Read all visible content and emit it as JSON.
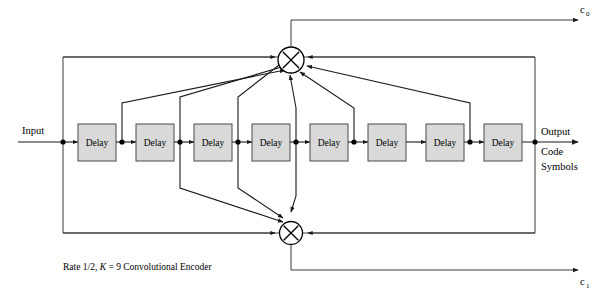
{
  "figure": {
    "type": "block-diagram",
    "title": "Rate 1/2, K = 9 Convolutional Encoder",
    "caption_parts": {
      "before": "Rate 1/2, ",
      "italic": "K",
      "after": " = 9 Convolutional Encoder"
    },
    "background_color": "#ffffff",
    "line_color": "#1a1a1a",
    "delay_fill_color": "#d9d9d9",
    "delay_stroke_color": "#4a4a4a"
  },
  "labels": {
    "input": "Input",
    "output_line1": "Output",
    "output_line2": "Code",
    "output_line3": "Symbols",
    "c0_base": "c",
    "c0_sub": "0",
    "c1_base": "c",
    "c1_sub": "1"
  },
  "delays": [
    {
      "label": "Delay",
      "index": 1
    },
    {
      "label": "Delay",
      "index": 2
    },
    {
      "label": "Delay",
      "index": 3
    },
    {
      "label": "Delay",
      "index": 4
    },
    {
      "label": "Delay",
      "index": 5
    },
    {
      "label": "Delay",
      "index": 6
    },
    {
      "label": "Delay",
      "index": 7
    },
    {
      "label": "Delay",
      "index": 8
    }
  ],
  "adders": [
    {
      "name": "top-adder",
      "operation": "xor",
      "output": "c0"
    },
    {
      "name": "bottom-adder",
      "operation": "xor",
      "output": "c1"
    }
  ],
  "taps": {
    "top_adder_sources": [
      "input",
      "d1",
      "d2",
      "d3",
      "d4",
      "d5",
      "d7",
      "output"
    ],
    "bottom_adder_sources": [
      "input",
      "d2",
      "d3",
      "d4",
      "output"
    ]
  }
}
